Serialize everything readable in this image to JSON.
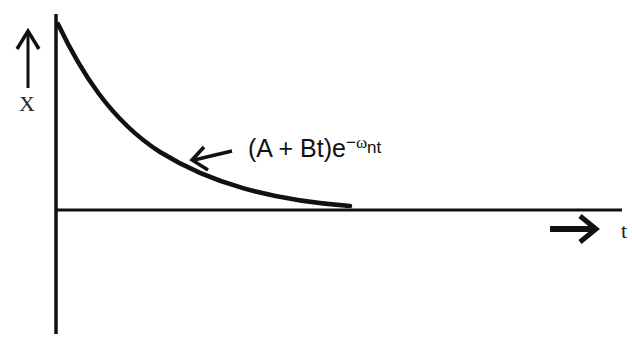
{
  "diagram": {
    "type": "critically-damped-response",
    "y_axis_label": "X",
    "x_axis_label": "t",
    "curve_label": {
      "prefix": "(A + Bt)e",
      "exponent_sign": "−",
      "exponent_omega": "ω",
      "exponent_sub": "nt"
    },
    "colors": {
      "background": "#ffffff",
      "stroke": "#111111"
    }
  }
}
